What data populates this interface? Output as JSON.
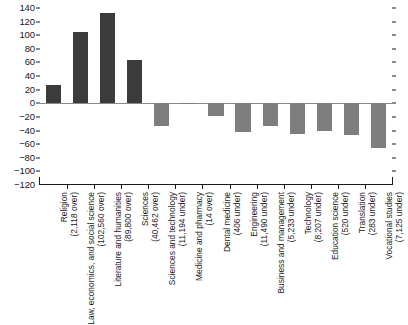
{
  "chart_data": {
    "type": "bar",
    "title": "",
    "subtitle": "",
    "xlabel": "",
    "ylabel": "",
    "ylim": [
      -120,
      140
    ],
    "ytick_values": [
      140,
      120,
      100,
      80,
      60,
      40,
      20,
      0,
      -20,
      -40,
      -60,
      -80,
      -100,
      -120
    ],
    "ytick_labels": [
      "140",
      "120",
      "100",
      "80",
      "60",
      "40",
      "20",
      "0",
      "-20",
      "-40",
      "-60",
      "-80",
      "-100",
      "-120"
    ],
    "grid": false,
    "legend": null,
    "zero_line": true,
    "right_axis_ticks": true,
    "colors": {
      "positive_bar": "#3b3b3b",
      "negative_bar": "#7e7e7e",
      "axis": "#1a1a1a",
      "zero_line": "#8a8a8a",
      "background": "#ffffff"
    },
    "categories": [
      "Religion",
      "Law, economics, and social science",
      "Literature and humanities",
      "Sciences",
      "Sciences and technology",
      "Medicine and pharmacy",
      "Dental medicine",
      "Engineering",
      "Business and management",
      "Technology",
      "Education science",
      "Translation",
      "Vocational studies"
    ],
    "category_sublabels": [
      "(2,118 over)",
      "(102,560 over)",
      "(89,800 over)",
      "(40,462 over)",
      "(11,194 under)",
      "(14 over)",
      "(406 under)",
      "(11,490 under)",
      "(5,233 under)",
      "(8,207 under)",
      "(520 under)",
      "(283 under)",
      "(7,125 under)"
    ],
    "values": [
      27,
      105,
      133,
      64,
      -33,
      -1,
      -19,
      -42,
      -34,
      -45,
      -40,
      -47,
      -66
    ]
  }
}
